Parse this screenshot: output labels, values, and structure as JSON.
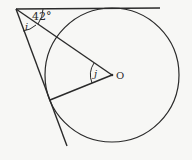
{
  "diagram": {
    "labels": {
      "angle_top": "42°",
      "angle_i": "i",
      "angle_j": "j",
      "center": "O"
    },
    "colors": {
      "stroke": "#2a2a2a",
      "background": "#f7f7f5"
    },
    "geometry": {
      "vertex": [
        16,
        9
      ],
      "center": [
        112,
        75
      ],
      "radius": 67,
      "top_tangent_end": [
        160,
        8
      ],
      "lower_tangent_end": [
        67,
        146
      ],
      "lower_tangent_point": [
        50,
        100
      ]
    }
  }
}
